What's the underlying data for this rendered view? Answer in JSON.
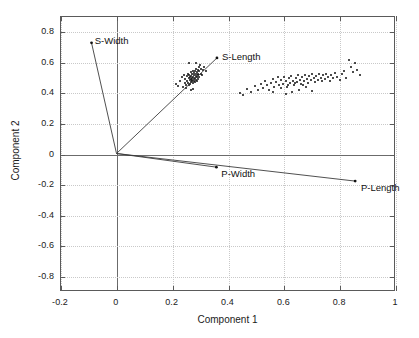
{
  "chart_data": {
    "type": "scatter",
    "title": "",
    "xlabel": "Component 1",
    "ylabel": "Component 2",
    "xlim": [
      -0.2,
      1.0
    ],
    "ylim": [
      -0.9,
      0.9
    ],
    "xticks": [
      "-0.2",
      "0",
      "0.2",
      "0.4",
      "0.6",
      "0.8",
      "1"
    ],
    "xtickvalues": [
      -0.2,
      0,
      0.2,
      0.4,
      0.6,
      0.8,
      1.0
    ],
    "yticks": [
      "0.8",
      "0.6",
      "0.4",
      "0.2",
      "0",
      "-0.2",
      "-0.4",
      "-0.6",
      "-0.8"
    ],
    "ytickvalues": [
      0.8,
      0.6,
      0.4,
      0.2,
      0,
      -0.2,
      -0.4,
      -0.6,
      -0.8
    ],
    "grid": true,
    "legend": "none",
    "marker": "dot",
    "marker_color": "#111111",
    "vector_color": "#3a3a3a",
    "grid_color": "#c9c9c9",
    "axis_color": "#5a5a5a",
    "vectors": [
      {
        "label": "S-Width",
        "x": -0.09,
        "y": 0.73,
        "label_dx": 4,
        "label_dy": -7
      },
      {
        "label": "S-Length",
        "x": 0.362,
        "y": 0.63,
        "label_dx": 5,
        "label_dy": -6
      },
      {
        "label": "P-Width",
        "x": 0.36,
        "y": -0.09,
        "label_dx": 5,
        "label_dy": 1
      },
      {
        "label": "P-Length",
        "x": 0.86,
        "y": -0.182,
        "label_dx": 5,
        "label_dy": 1
      }
    ],
    "points": [
      [
        0.212,
        0.462
      ],
      [
        0.218,
        0.448
      ],
      [
        0.228,
        0.48
      ],
      [
        0.232,
        0.505
      ],
      [
        0.236,
        0.44
      ],
      [
        0.24,
        0.52
      ],
      [
        0.243,
        0.468
      ],
      [
        0.245,
        0.495
      ],
      [
        0.247,
        0.455
      ],
      [
        0.25,
        0.512
      ],
      [
        0.252,
        0.482
      ],
      [
        0.254,
        0.53
      ],
      [
        0.255,
        0.47
      ],
      [
        0.257,
        0.498
      ],
      [
        0.258,
        0.452
      ],
      [
        0.26,
        0.52
      ],
      [
        0.261,
        0.485
      ],
      [
        0.262,
        0.505
      ],
      [
        0.263,
        0.462
      ],
      [
        0.264,
        0.538
      ],
      [
        0.265,
        0.492
      ],
      [
        0.266,
        0.472
      ],
      [
        0.267,
        0.515
      ],
      [
        0.268,
        0.5
      ],
      [
        0.269,
        0.478
      ],
      [
        0.27,
        0.528
      ],
      [
        0.271,
        0.49
      ],
      [
        0.272,
        0.508
      ],
      [
        0.273,
        0.466
      ],
      [
        0.274,
        0.545
      ],
      [
        0.275,
        0.497
      ],
      [
        0.276,
        0.52
      ],
      [
        0.277,
        0.483
      ],
      [
        0.278,
        0.535
      ],
      [
        0.279,
        0.502
      ],
      [
        0.28,
        0.475
      ],
      [
        0.281,
        0.548
      ],
      [
        0.282,
        0.512
      ],
      [
        0.283,
        0.49
      ],
      [
        0.284,
        0.525
      ],
      [
        0.285,
        0.56
      ],
      [
        0.286,
        0.505
      ],
      [
        0.287,
        0.482
      ],
      [
        0.288,
        0.54
      ],
      [
        0.289,
        0.518
      ],
      [
        0.29,
        0.495
      ],
      [
        0.291,
        0.552
      ],
      [
        0.292,
        0.528
      ],
      [
        0.294,
        0.572
      ],
      [
        0.295,
        0.51
      ],
      [
        0.296,
        0.545
      ],
      [
        0.298,
        0.585
      ],
      [
        0.3,
        0.53
      ],
      [
        0.302,
        0.56
      ],
      [
        0.305,
        0.52
      ],
      [
        0.308,
        0.55
      ],
      [
        0.312,
        0.572
      ],
      [
        0.318,
        0.545
      ],
      [
        0.265,
        0.425
      ],
      [
        0.272,
        0.432
      ],
      [
        0.258,
        0.598
      ],
      [
        0.285,
        0.602
      ],
      [
        0.248,
        0.438
      ],
      [
        0.44,
        0.405
      ],
      [
        0.452,
        0.388
      ],
      [
        0.468,
        0.43
      ],
      [
        0.482,
        0.412
      ],
      [
        0.495,
        0.448
      ],
      [
        0.505,
        0.425
      ],
      [
        0.515,
        0.462
      ],
      [
        0.522,
        0.438
      ],
      [
        0.53,
        0.478
      ],
      [
        0.538,
        0.452
      ],
      [
        0.545,
        0.425
      ],
      [
        0.552,
        0.468
      ],
      [
        0.558,
        0.495
      ],
      [
        0.564,
        0.442
      ],
      [
        0.57,
        0.472
      ],
      [
        0.576,
        0.505
      ],
      [
        0.582,
        0.455
      ],
      [
        0.588,
        0.488
      ],
      [
        0.594,
        0.462
      ],
      [
        0.6,
        0.51
      ],
      [
        0.605,
        0.478
      ],
      [
        0.61,
        0.445
      ],
      [
        0.615,
        0.498
      ],
      [
        0.62,
        0.468
      ],
      [
        0.625,
        0.512
      ],
      [
        0.63,
        0.482
      ],
      [
        0.635,
        0.455
      ],
      [
        0.64,
        0.502
      ],
      [
        0.645,
        0.475
      ],
      [
        0.65,
        0.522
      ],
      [
        0.655,
        0.49
      ],
      [
        0.66,
        0.462
      ],
      [
        0.665,
        0.508
      ],
      [
        0.67,
        0.48
      ],
      [
        0.675,
        0.518
      ],
      [
        0.68,
        0.495
      ],
      [
        0.685,
        0.468
      ],
      [
        0.69,
        0.512
      ],
      [
        0.695,
        0.485
      ],
      [
        0.7,
        0.525
      ],
      [
        0.705,
        0.498
      ],
      [
        0.71,
        0.472
      ],
      [
        0.715,
        0.515
      ],
      [
        0.72,
        0.488
      ],
      [
        0.725,
        0.528
      ],
      [
        0.73,
        0.502
      ],
      [
        0.735,
        0.478
      ],
      [
        0.74,
        0.518
      ],
      [
        0.745,
        0.492
      ],
      [
        0.75,
        0.53
      ],
      [
        0.756,
        0.505
      ],
      [
        0.762,
        0.482
      ],
      [
        0.768,
        0.522
      ],
      [
        0.775,
        0.498
      ],
      [
        0.782,
        0.535
      ],
      [
        0.79,
        0.508
      ],
      [
        0.798,
        0.485
      ],
      [
        0.806,
        0.525
      ],
      [
        0.815,
        0.548
      ],
      [
        0.822,
        0.502
      ],
      [
        0.83,
        0.62
      ],
      [
        0.838,
        0.572
      ],
      [
        0.845,
        0.538
      ],
      [
        0.852,
        0.598
      ],
      [
        0.862,
        0.555
      ],
      [
        0.872,
        0.518
      ],
      [
        0.605,
        0.398
      ],
      [
        0.628,
        0.408
      ],
      [
        0.652,
        0.425
      ],
      [
        0.676,
        0.44
      ],
      [
        0.7,
        0.418
      ],
      [
        0.56,
        0.412
      ],
      [
        0.588,
        0.435
      ],
      [
        0.612,
        0.452
      ],
      [
        0.638,
        0.465
      ],
      [
        0.668,
        0.455
      ]
    ]
  }
}
